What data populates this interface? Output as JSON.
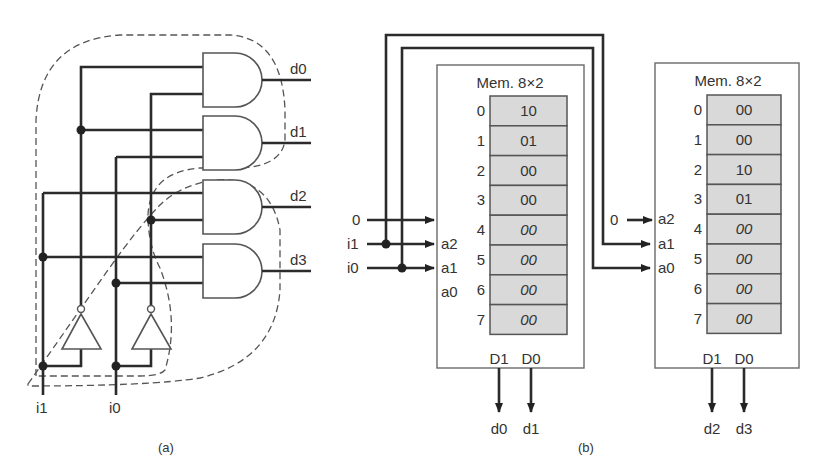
{
  "panel_a": {
    "caption": "(a)",
    "outputs": [
      "d0",
      "d1",
      "d2",
      "d3"
    ],
    "inputs": [
      "i1",
      "i0"
    ]
  },
  "panel_b": {
    "caption": "(b)",
    "left_inputs": {
      "a2_value": "0",
      "a1_signal": "i1",
      "a0_signal": "i0"
    },
    "right_inputs": {
      "a2_value": "0"
    },
    "memories": [
      {
        "title": "Mem. 8×2",
        "address_pins": [
          "a2",
          "a1",
          "a0"
        ],
        "data_pins": [
          "D1",
          "D0"
        ],
        "outputs": [
          "d0",
          "d1"
        ],
        "rows": [
          {
            "addr": "0",
            "value": "10",
            "italic": false
          },
          {
            "addr": "1",
            "value": "01",
            "italic": false
          },
          {
            "addr": "2",
            "value": "00",
            "italic": false
          },
          {
            "addr": "3",
            "value": "00",
            "italic": false
          },
          {
            "addr": "4",
            "value": "00",
            "italic": true
          },
          {
            "addr": "5",
            "value": "00",
            "italic": true
          },
          {
            "addr": "6",
            "value": "00",
            "italic": true
          },
          {
            "addr": "7",
            "value": "00",
            "italic": true
          }
        ]
      },
      {
        "title": "Mem. 8×2",
        "address_pins": [
          "a2",
          "a1",
          "a0"
        ],
        "data_pins": [
          "D1",
          "D0"
        ],
        "outputs": [
          "d2",
          "d3"
        ],
        "rows": [
          {
            "addr": "0",
            "value": "00",
            "italic": false
          },
          {
            "addr": "1",
            "value": "00",
            "italic": false
          },
          {
            "addr": "2",
            "value": "10",
            "italic": false
          },
          {
            "addr": "3",
            "value": "01",
            "italic": false
          },
          {
            "addr": "4",
            "value": "00",
            "italic": true
          },
          {
            "addr": "5",
            "value": "00",
            "italic": true
          },
          {
            "addr": "6",
            "value": "00",
            "italic": true
          },
          {
            "addr": "7",
            "value": "00",
            "italic": true
          }
        ]
      }
    ]
  }
}
